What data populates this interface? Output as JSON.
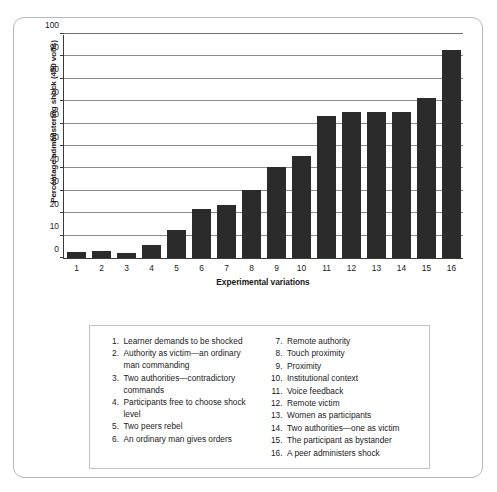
{
  "chart_data": {
    "type": "bar",
    "title": "",
    "xlabel": "Experimental variations",
    "ylabel": "Percentage administering shock (450 volts)",
    "categories": [
      "1",
      "2",
      "3",
      "4",
      "5",
      "6",
      "7",
      "8",
      "9",
      "10",
      "11",
      "12",
      "13",
      "14",
      "15",
      "16"
    ],
    "values": [
      2.5,
      3.2,
      2.2,
      5.6,
      12.5,
      21.7,
      23.5,
      30.5,
      40.5,
      45.5,
      63.5,
      65.0,
      65.0,
      65.2,
      71.5,
      93.0
    ],
    "ylim": [
      0,
      100
    ],
    "yticks": [
      0,
      10,
      20,
      30,
      40,
      50,
      60,
      70,
      80,
      90,
      100
    ],
    "ytick_labels": [
      "0",
      "10",
      "20",
      "30",
      "40",
      "50",
      "60",
      "70",
      "80",
      "90",
      "100"
    ],
    "grid": true,
    "legend_position": "below-chart",
    "bar_color": "#2b2b2b",
    "gridline_color": "#8c8c8c",
    "axis_color": "#3a3a3a"
  },
  "legend": {
    "left_column": [
      {
        "num": "1.",
        "text": "Learner demands to be shocked"
      },
      {
        "num": "2.",
        "text": "Authority as victim—an ordinary man commanding"
      },
      {
        "num": "3.",
        "text": "Two authorities—contradictory commands"
      },
      {
        "num": "4.",
        "text": "Participants free to choose shock level"
      },
      {
        "num": "5.",
        "text": "Two peers rebel"
      },
      {
        "num": "6.",
        "text": "An ordinary man gives orders"
      }
    ],
    "right_column": [
      {
        "num": "7.",
        "text": "Remote authority"
      },
      {
        "num": "8.",
        "text": "Touch proximity"
      },
      {
        "num": "9.",
        "text": "Proximity"
      },
      {
        "num": "10.",
        "text": "Institutional context"
      },
      {
        "num": "11.",
        "text": "Voice feedback"
      },
      {
        "num": "12.",
        "text": "Remote victim"
      },
      {
        "num": "13.",
        "text": "Women as participants"
      },
      {
        "num": "14.",
        "text": "Two authorities—one as victim"
      },
      {
        "num": "15.",
        "text": "The participant as bystander"
      },
      {
        "num": "16.",
        "text": "A peer administers shock"
      }
    ]
  }
}
